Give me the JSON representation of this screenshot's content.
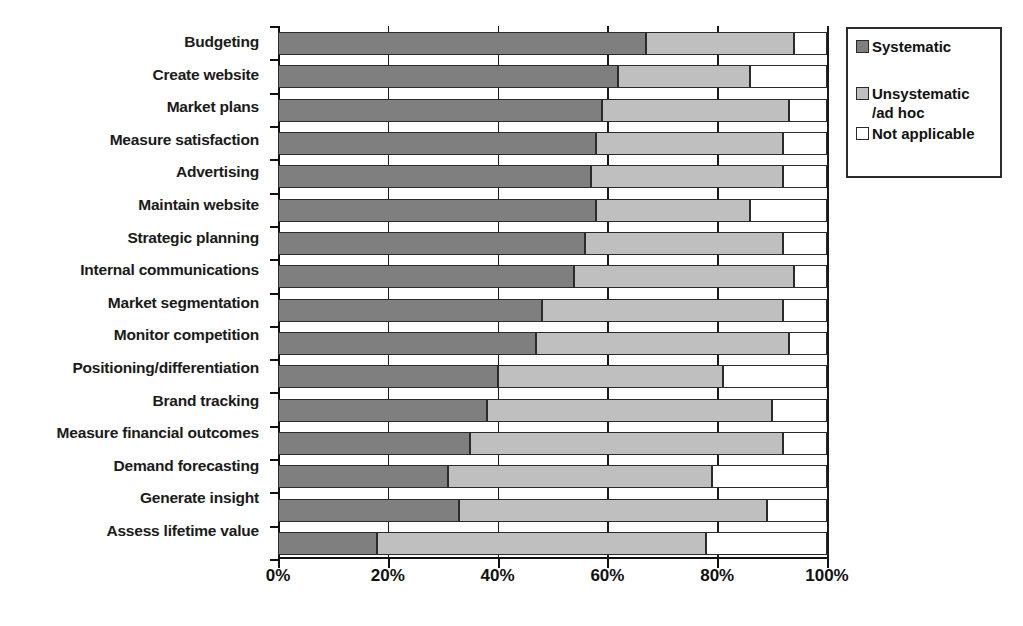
{
  "chart_data": {
    "type": "bar",
    "subtype": "horizontal-stacked-100",
    "title": "",
    "xlabel": "",
    "ylabel": "",
    "xlim": [
      0,
      100
    ],
    "grid": true,
    "legend_position": "right",
    "xticks": [
      "0%",
      "20%",
      "40%",
      "60%",
      "80%",
      "100%"
    ],
    "xtick_values": [
      0,
      20,
      40,
      60,
      80,
      100
    ],
    "categories": [
      "Budgeting",
      "Create website",
      "Market plans",
      "Measure satisfaction",
      "Advertising",
      "Maintain website",
      "Strategic planning",
      "Internal communications",
      "Market segmentation",
      "Monitor competition",
      "Positioning/differentiation",
      "Brand tracking",
      "Measure financial outcomes",
      "Demand forecasting",
      "Generate insight",
      "Assess lifetime value"
    ],
    "series": [
      {
        "name": "Systematic",
        "color": "#7f7f7f",
        "values": [
          67,
          62,
          59,
          58,
          57,
          58,
          56,
          54,
          48,
          47,
          40,
          38,
          35,
          31,
          33,
          18
        ]
      },
      {
        "name": "Unsystematic /ad hoc",
        "color": "#bfbfbf",
        "values": [
          27,
          24,
          34,
          34,
          35,
          28,
          36,
          40,
          44,
          46,
          41,
          52,
          57,
          48,
          56,
          60
        ]
      },
      {
        "name": "Not applicable",
        "color": "#ffffff",
        "values": [
          6,
          14,
          7,
          8,
          8,
          14,
          8,
          6,
          8,
          7,
          19,
          10,
          8,
          21,
          11,
          22
        ]
      }
    ]
  },
  "legend": {
    "items": [
      {
        "label": "Systematic",
        "swatch": "sys"
      },
      {
        "label": "Unsystematic\n/ad hoc",
        "swatch": "uns"
      },
      {
        "label": "Not applicable",
        "swatch": "na"
      }
    ]
  }
}
